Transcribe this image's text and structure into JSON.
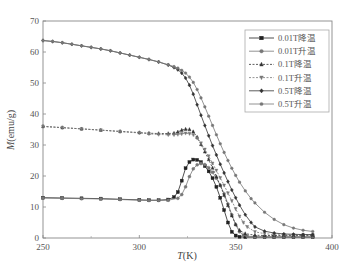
{
  "chart_data": {
    "type": "line",
    "title": "",
    "xlabel": "T(K)",
    "xlabel_italic": "T",
    "xlabel_rest": "(K)",
    "ylabel": "M(emu/g)",
    "ylabel_italic": "M",
    "ylabel_rest": "(emu/g)",
    "xlim": [
      250,
      400
    ],
    "ylim": [
      0,
      70
    ],
    "xticks": [
      250,
      300,
      350,
      400
    ],
    "yticks": [
      0,
      10,
      20,
      30,
      40,
      50,
      60,
      70
    ],
    "grid": false,
    "legend_position": "upper right",
    "series": [
      {
        "name": "0.01T降温",
        "marker": "square",
        "dash": "solid",
        "color": "#222222",
        "x": [
          250,
          260,
          270,
          280,
          290,
          300,
          305,
          310,
          315,
          318,
          320,
          322,
          324,
          326,
          328,
          330,
          332,
          334,
          336,
          338,
          340,
          342,
          344,
          346,
          348,
          350,
          352,
          355,
          360,
          365,
          370,
          375,
          380,
          385,
          390
        ],
        "y": [
          13.0,
          12.9,
          12.8,
          12.7,
          12.5,
          12.3,
          12.2,
          12.2,
          12.4,
          13.2,
          14.8,
          18.5,
          22.5,
          24.5,
          25.3,
          25.2,
          24.5,
          23.2,
          21.5,
          19.3,
          16.5,
          13.0,
          9.0,
          5.0,
          2.0,
          0.8,
          0.4,
          0.3,
          0.3,
          0.3,
          0.3,
          0.3,
          0.3,
          0.3,
          0.3
        ]
      },
      {
        "name": "0.01T升温",
        "marker": "circle",
        "dash": "solid",
        "color": "#777777",
        "x": [
          250,
          260,
          270,
          280,
          290,
          300,
          305,
          310,
          315,
          320,
          322,
          324,
          326,
          328,
          330,
          332,
          334,
          336,
          338,
          340,
          342,
          344,
          346,
          348,
          350,
          352,
          354,
          356,
          360,
          365,
          370,
          375,
          380,
          385,
          390
        ],
        "y": [
          12.9,
          12.8,
          12.7,
          12.6,
          12.4,
          12.2,
          12.1,
          12.1,
          12.2,
          12.8,
          14.0,
          16.5,
          19.8,
          22.3,
          23.6,
          24.0,
          23.7,
          22.7,
          21.2,
          19.3,
          17.0,
          14.3,
          11.0,
          7.5,
          4.3,
          2.0,
          1.0,
          0.6,
          0.4,
          0.4,
          0.4,
          0.4,
          0.4,
          0.4,
          0.4
        ]
      },
      {
        "name": "0.1T降温",
        "marker": "triangle-up",
        "dash": "dashed",
        "color": "#333333",
        "x": [
          250,
          260,
          270,
          280,
          290,
          300,
          305,
          310,
          315,
          318,
          320,
          322,
          324,
          326,
          328,
          330,
          332,
          334,
          336,
          338,
          340,
          342,
          344,
          346,
          348,
          350,
          352,
          355,
          360,
          365,
          370,
          375,
          380,
          385,
          390
        ],
        "y": [
          36.0,
          35.6,
          35.2,
          34.8,
          34.4,
          34.0,
          33.8,
          33.7,
          33.7,
          33.8,
          34.2,
          34.8,
          35.1,
          35.0,
          34.3,
          32.5,
          30.2,
          27.8,
          25.3,
          22.6,
          19.8,
          17.0,
          13.8,
          10.5,
          7.2,
          4.4,
          2.5,
          1.4,
          0.9,
          0.8,
          0.8,
          0.8,
          0.8,
          0.8,
          0.8
        ]
      },
      {
        "name": "0.1T升温",
        "marker": "triangle-down",
        "dash": "dashed",
        "color": "#777777",
        "x": [
          250,
          260,
          270,
          280,
          290,
          300,
          305,
          310,
          315,
          318,
          320,
          322,
          324,
          326,
          328,
          330,
          332,
          334,
          336,
          338,
          340,
          342,
          344,
          346,
          348,
          350,
          352,
          354,
          356,
          360,
          365,
          370,
          375,
          380,
          385,
          390
        ],
        "y": [
          36.0,
          35.6,
          35.2,
          34.8,
          34.3,
          33.9,
          33.6,
          33.4,
          33.3,
          33.3,
          33.4,
          33.6,
          33.8,
          33.7,
          33.3,
          32.2,
          30.6,
          28.6,
          26.4,
          24.1,
          21.8,
          19.4,
          17.0,
          14.5,
          12.0,
          9.4,
          7.0,
          5.0,
          3.6,
          2.0,
          1.4,
          1.1,
          1.0,
          1.0,
          1.0,
          1.0
        ]
      },
      {
        "name": "0.5T降温",
        "marker": "diamond",
        "dash": "solid",
        "color": "#333333",
        "x": [
          250,
          255,
          260,
          265,
          270,
          275,
          280,
          285,
          290,
          295,
          300,
          305,
          310,
          315,
          318,
          320,
          322,
          324,
          326,
          328,
          330,
          332,
          334,
          336,
          338,
          340,
          342,
          344,
          346,
          348,
          350,
          352,
          355,
          358,
          360,
          365,
          370,
          375,
          380,
          385,
          390
        ],
        "y": [
          63.7,
          63.4,
          63.0,
          62.5,
          62.0,
          61.5,
          61.0,
          60.4,
          59.7,
          59.0,
          58.3,
          57.6,
          56.8,
          55.8,
          55.0,
          54.3,
          53.2,
          51.6,
          49.3,
          46.4,
          43.0,
          39.6,
          36.3,
          33.0,
          29.8,
          26.8,
          23.8,
          21.0,
          18.2,
          15.5,
          13.0,
          10.6,
          7.5,
          5.0,
          3.6,
          2.2,
          1.6,
          1.3,
          1.2,
          1.1,
          1.1
        ]
      },
      {
        "name": "0.5T升温",
        "marker": "star",
        "dash": "solid",
        "color": "#777777",
        "x": [
          250,
          255,
          260,
          265,
          270,
          275,
          280,
          285,
          290,
          295,
          300,
          305,
          310,
          315,
          318,
          320,
          322,
          324,
          326,
          328,
          330,
          332,
          334,
          336,
          338,
          340,
          342,
          344,
          346,
          348,
          350,
          352,
          355,
          358,
          360,
          365,
          370,
          375,
          380,
          385,
          390
        ],
        "y": [
          63.7,
          63.4,
          63.0,
          62.5,
          62.0,
          61.5,
          61.0,
          60.4,
          59.7,
          59.0,
          58.3,
          57.6,
          56.8,
          55.9,
          55.3,
          54.8,
          54.1,
          53.2,
          51.9,
          50.2,
          47.9,
          45.2,
          42.3,
          39.3,
          36.3,
          33.3,
          30.4,
          27.6,
          25.0,
          22.5,
          20.2,
          18.0,
          15.2,
          12.7,
          11.3,
          8.3,
          6.0,
          4.3,
          3.2,
          2.5,
          2.1
        ]
      }
    ]
  }
}
